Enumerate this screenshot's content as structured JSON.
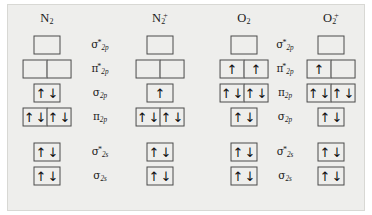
{
  "figure": {
    "type": "molecular-orbital-diagram",
    "background_color": "#eeeeec",
    "box_border_color": "#4a4a4a",
    "text_color": "#1a1a1a"
  },
  "columns": [
    {
      "id": "n2",
      "name": "N",
      "sub": "2",
      "sup": ""
    },
    {
      "id": "n2plus",
      "name": "N",
      "sub": "2",
      "sup": "+"
    },
    {
      "id": "o2",
      "name": "O",
      "sub": "2",
      "sup": ""
    },
    {
      "id": "o2plus",
      "name": "O",
      "sub": "2",
      "sup": "+"
    }
  ],
  "label_columns": {
    "left": {
      "serves": "N2 / N2+",
      "labels": [
        {
          "greek": "σ",
          "star": "*",
          "sub": "2p"
        },
        {
          "greek": "π",
          "star": "*",
          "sub": "2p"
        },
        {
          "greek": "σ",
          "star": "",
          "sub": "2p"
        },
        {
          "greek": "π",
          "star": "",
          "sub": "2p"
        },
        {
          "greek": "σ",
          "star": "*",
          "sub": "2s"
        },
        {
          "greek": "σ",
          "star": "",
          "sub": "2s"
        }
      ]
    },
    "right": {
      "serves": "O2 / O2+",
      "labels": [
        {
          "greek": "σ",
          "star": "*",
          "sub": "2p"
        },
        {
          "greek": "π",
          "star": "*",
          "sub": "2p"
        },
        {
          "greek": "π",
          "star": "",
          "sub": "2p"
        },
        {
          "greek": "σ",
          "star": "",
          "sub": "2p"
        },
        {
          "greek": "σ",
          "star": "*",
          "sub": "2s"
        },
        {
          "greek": "σ",
          "star": "",
          "sub": "2s"
        }
      ]
    }
  },
  "rows": [
    {
      "index": 0,
      "left_label": "σ*2p",
      "right_label": "σ*2p",
      "boxes": 1
    },
    {
      "index": 1,
      "left_label": "π*2p",
      "right_label": "π*2p",
      "boxes": 2
    },
    {
      "index": 2,
      "left_label": "σ2p",
      "right_label": "π2p",
      "boxes": "varies"
    },
    {
      "index": 3,
      "left_label": "π2p",
      "right_label": "σ2p",
      "boxes": "varies"
    },
    {
      "index": 4,
      "left_label": "σ*2s",
      "right_label": "σ*2s",
      "boxes": 1
    },
    {
      "index": 5,
      "left_label": "σ2s",
      "right_label": "σ2s",
      "boxes": 1
    }
  ],
  "occupancies": {
    "n2": [
      {
        "row": 0,
        "cells": [
          ""
        ]
      },
      {
        "row": 1,
        "cells": [
          "",
          ""
        ]
      },
      {
        "row": 2,
        "cells": [
          "ud"
        ]
      },
      {
        "row": 3,
        "cells": [
          "ud",
          "ud"
        ]
      },
      {
        "row": 4,
        "cells": [
          "ud"
        ]
      },
      {
        "row": 5,
        "cells": [
          "ud"
        ]
      }
    ],
    "n2plus": [
      {
        "row": 0,
        "cells": [
          ""
        ]
      },
      {
        "row": 1,
        "cells": [
          "",
          ""
        ]
      },
      {
        "row": 2,
        "cells": [
          "u"
        ]
      },
      {
        "row": 3,
        "cells": [
          "ud",
          "ud"
        ]
      },
      {
        "row": 4,
        "cells": [
          "ud"
        ]
      },
      {
        "row": 5,
        "cells": [
          "ud"
        ]
      }
    ],
    "o2": [
      {
        "row": 0,
        "cells": [
          ""
        ]
      },
      {
        "row": 1,
        "cells": [
          "u",
          "u"
        ]
      },
      {
        "row": 2,
        "cells": [
          "ud",
          "ud"
        ]
      },
      {
        "row": 3,
        "cells": [
          "ud"
        ]
      },
      {
        "row": 4,
        "cells": [
          "ud"
        ]
      },
      {
        "row": 5,
        "cells": [
          "ud"
        ]
      }
    ],
    "o2plus": [
      {
        "row": 0,
        "cells": [
          ""
        ]
      },
      {
        "row": 1,
        "cells": [
          "u",
          ""
        ]
      },
      {
        "row": 2,
        "cells": [
          "ud",
          "ud"
        ]
      },
      {
        "row": 3,
        "cells": [
          "ud"
        ]
      },
      {
        "row": 4,
        "cells": [
          "ud"
        ]
      },
      {
        "row": 5,
        "cells": [
          "ud"
        ]
      }
    ]
  },
  "glyphs": {
    "up": "↑",
    "down": "↓"
  }
}
